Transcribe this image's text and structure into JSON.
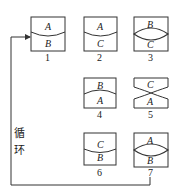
{
  "diagram": {
    "type": "cycle-sequence",
    "loop_label_chars": [
      "循",
      "环"
    ],
    "loop_label": "循环",
    "stroke_color": "#333333",
    "background": "#ffffff",
    "steps": [
      {
        "id": "1",
        "number": "1",
        "top": "A",
        "bottom": "B",
        "shape": "curve-down"
      },
      {
        "id": "2",
        "number": "2",
        "top": "A",
        "bottom": "C",
        "shape": "curve-down"
      },
      {
        "id": "3",
        "number": "3",
        "top": "B",
        "bottom": "C",
        "shape": "lens"
      },
      {
        "id": "4",
        "number": "4",
        "top": "B",
        "bottom": "A",
        "shape": "curve-up"
      },
      {
        "id": "5",
        "number": "5",
        "top": "C",
        "bottom": "A",
        "shape": "hourglass"
      },
      {
        "id": "6",
        "number": "6",
        "top": "C",
        "bottom": "B",
        "shape": "curve-down"
      },
      {
        "id": "7",
        "number": "7",
        "top": "A",
        "bottom": "B",
        "shape": "lens"
      }
    ]
  }
}
